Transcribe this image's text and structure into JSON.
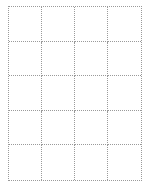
{
  "grid": {
    "columns": 4,
    "rows": 5,
    "line_color": "#9a9a9a",
    "line_style": "dotted",
    "cells": []
  }
}
